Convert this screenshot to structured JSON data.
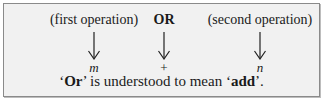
{
  "diagram": {
    "columns": [
      {
        "label": "(first operation)",
        "bold": false,
        "symbol": "m",
        "symbol_italic": true
      },
      {
        "label": "OR",
        "bold": true,
        "symbol": "+",
        "symbol_italic": false
      },
      {
        "label": "(second operation)",
        "bold": false,
        "symbol": "n",
        "symbol_italic": true
      }
    ],
    "caption": {
      "q1": "‘",
      "word_or": "Or",
      "mid": "’ is understood to mean ‘",
      "word_add": "add",
      "end": "’."
    }
  }
}
